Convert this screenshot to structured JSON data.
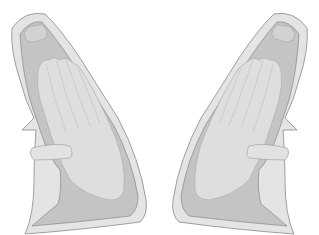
{
  "figure": {
    "panels": [
      {
        "id": "left",
        "side": "left"
      },
      {
        "id": "right",
        "side": "right"
      }
    ]
  },
  "colors": {
    "background": "#ffffff",
    "outer_sheath": "#e4e4e4",
    "outer_stroke": "#8a8a8a",
    "inner_cavity": "#c4c4c4",
    "hand": "#dedede",
    "hand_stroke": "#a8a8a8",
    "strap": "#e2e2e2"
  }
}
